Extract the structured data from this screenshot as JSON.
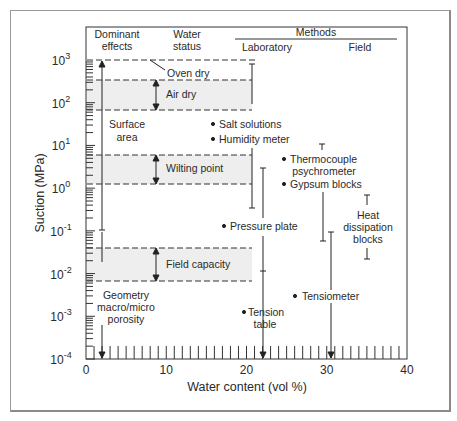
{
  "chart_data": {
    "type": "range",
    "title": "",
    "xlabel": "Water content (vol %)",
    "ylabel": "Suction (MPa)",
    "xlim": [
      0,
      40
    ],
    "ylim_log10": [
      -4,
      3
    ],
    "yscale": "log",
    "x_ticks": [
      "0",
      "10",
      "20",
      "30",
      "40"
    ],
    "y_ticks": [
      {
        "base": "10",
        "exp": "3"
      },
      {
        "base": "10",
        "exp": "2"
      },
      {
        "base": "10",
        "exp": "1"
      },
      {
        "base": "10",
        "exp": "0"
      },
      {
        "base": "10",
        "exp": "-1"
      },
      {
        "base": "10",
        "exp": "-2"
      },
      {
        "base": "10",
        "exp": "-3"
      },
      {
        "base": "10",
        "exp": "-4"
      }
    ],
    "column_headers": {
      "dominant_effects": [
        "Dominant",
        "effects"
      ],
      "water_status": [
        "Water",
        "status"
      ],
      "methods": "Methods",
      "laboratory": "Laboratory",
      "field": "Field"
    },
    "water_status_bands": [
      {
        "label": "Air dry",
        "suction_range_MPa": [
          70,
          350
        ]
      },
      {
        "label": "Wilting point",
        "suction_range_MPa": [
          1.5,
          6
        ]
      },
      {
        "label": "Field capacity",
        "suction_range_MPa": [
          0.006,
          0.04
        ]
      }
    ],
    "reference_lines": [
      {
        "label": "Oven dry",
        "suction_MPa": 1000
      }
    ],
    "dominant_effects": [
      {
        "label": [
          "Surface",
          "area"
        ],
        "suction_range_MPa": [
          0.1,
          1000
        ]
      },
      {
        "label": [
          "Geometry",
          "macro/micro",
          "porosity"
        ],
        "suction_range_MPa": [
          0.0001,
          0.1
        ]
      }
    ],
    "methods": [
      {
        "group": "Laboratory",
        "label": [
          "Salt solutions"
        ],
        "suction_range_MPa": [
          70,
          1000
        ]
      },
      {
        "group": "Laboratory",
        "label": [
          "Humidity meter"
        ],
        "suction_range_MPa": [
          0.35,
          70
        ]
      },
      {
        "group": "Laboratory",
        "label": [
          "Pressure plate"
        ],
        "suction_range_MPa": [
          0.012,
          3
        ]
      },
      {
        "group": "Laboratory",
        "label": [
          "Tension",
          "table"
        ],
        "suction_range_MPa": [
          0.0001,
          0.012
        ]
      },
      {
        "group": "Field",
        "label": [
          "Thermocouple",
          "psychrometer"
        ],
        "suction_range_MPa": [
          0.06,
          8
        ]
      },
      {
        "group": "Field",
        "label": [
          "Gypsum blocks"
        ],
        "suction_range_MPa": [
          0.06,
          8
        ]
      },
      {
        "group": "Field",
        "label": [
          "Tensiometer"
        ],
        "suction_range_MPa": [
          0.0001,
          0.1
        ]
      },
      {
        "group": "Field",
        "label": [
          "Heat",
          "dissipation",
          "blocks"
        ],
        "suction_range_MPa": [
          0.02,
          0.7
        ]
      }
    ],
    "colors": {
      "band_fill": "#eeeeee",
      "line": "#2a2a2a",
      "frame": "#9a9a9a"
    }
  }
}
